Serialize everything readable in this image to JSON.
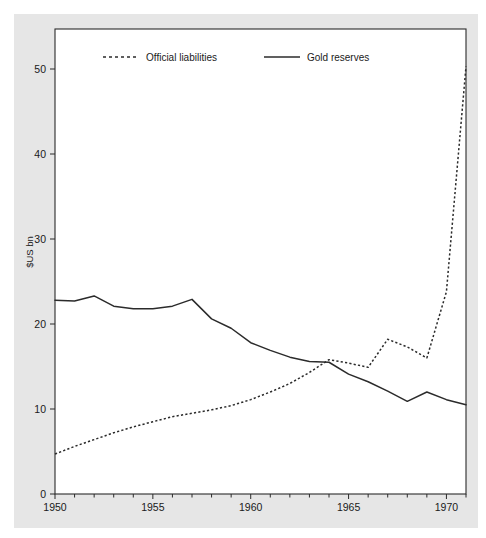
{
  "chart_data": {
    "type": "line",
    "title": "",
    "subtitle": "",
    "xlabel": "",
    "ylabel": "$US bn",
    "xlim": [
      1950,
      1971
    ],
    "ylim": [
      0,
      53
    ],
    "xticks": [
      1950,
      1955,
      1960,
      1965,
      1970
    ],
    "xtick_labels": [
      "1950",
      "1955",
      "1960",
      "1965",
      "1970"
    ],
    "xminor_step": 1,
    "yticks": [
      0,
      10,
      20,
      30,
      40,
      50
    ],
    "ytick_labels": [
      "0",
      "10",
      "20",
      "30",
      "40",
      "50"
    ],
    "grid": false,
    "legend_position": "top-inside",
    "x": [
      1950,
      1951,
      1952,
      1953,
      1954,
      1955,
      1956,
      1957,
      1958,
      1959,
      1960,
      1961,
      1962,
      1963,
      1964,
      1965,
      1966,
      1967,
      1968,
      1969,
      1970,
      1971
    ],
    "series": [
      {
        "name": "Official liabilities",
        "style": "dashed",
        "color": "#2b2b2b",
        "values": [
          4.7,
          5.6,
          6.4,
          7.2,
          7.9,
          8.5,
          9.1,
          9.5,
          9.9,
          10.4,
          11.1,
          12.0,
          13.0,
          14.3,
          15.8,
          15.4,
          14.9,
          18.2,
          17.3,
          16.0,
          23.8,
          50.3
        ]
      },
      {
        "name": "Gold reserves",
        "style": "solid",
        "color": "#2b2b2b",
        "values": [
          22.8,
          22.7,
          23.3,
          22.1,
          21.8,
          21.8,
          22.1,
          22.9,
          20.6,
          19.5,
          17.8,
          16.9,
          16.1,
          15.6,
          15.5,
          14.1,
          13.2,
          12.1,
          10.9,
          12.0,
          11.1,
          10.5
        ]
      }
    ],
    "annotations": []
  },
  "legend": {
    "entries": [
      {
        "label": "Official liabilities",
        "style": "dashed"
      },
      {
        "label": "Gold reserves",
        "style": "solid"
      }
    ]
  },
  "colors": {
    "figure_background": "#ffffff",
    "panel_background": "#e6e6e6",
    "plot_background": "#ffffff",
    "ink": "#2b2b2b"
  }
}
